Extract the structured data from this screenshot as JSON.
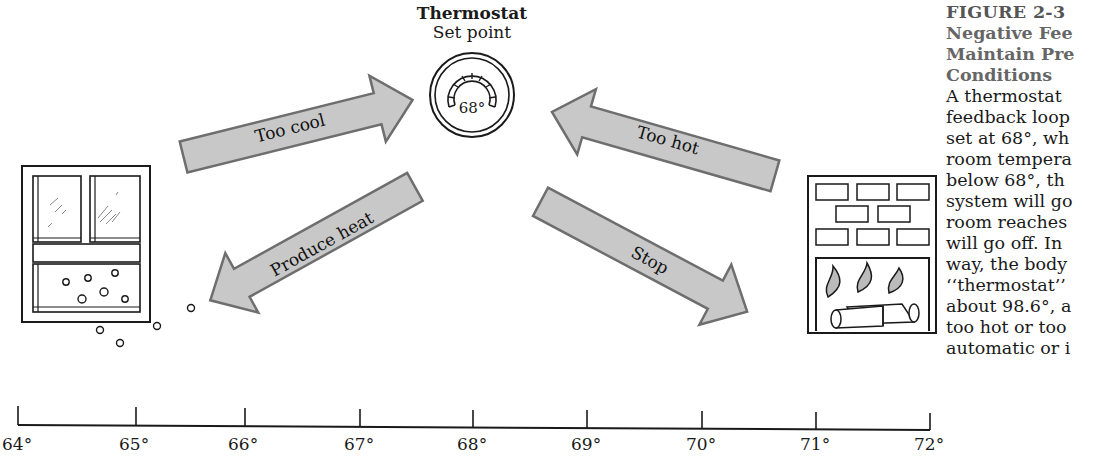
{
  "thermostat": {
    "title": "Thermostat",
    "subtitle": "Set point",
    "dial_value": "68°"
  },
  "arrows": {
    "too_cool": "Too cool",
    "produce_heat": "Produce heat",
    "too_hot": "Too hot",
    "stop": "Stop"
  },
  "scale": {
    "ticks": [
      "64°",
      "65°",
      "66°",
      "67°",
      "68°",
      "69°",
      "70°",
      "71°",
      "72°"
    ]
  },
  "caption": {
    "figure_label": "FIGURE 2-3",
    "title_lines": [
      "Negative Fee",
      "Maintain Pre",
      "Conditions"
    ],
    "body_lines": [
      "A thermostat",
      "feedback loop",
      "set at 68°, wh",
      "room tempera",
      "below 68°, th",
      "system will go",
      "room reaches",
      "will go off. In",
      "way, the body",
      "‘‘thermostat’’",
      "about 98.6°, a",
      "too hot or too",
      "automatic or i"
    ]
  },
  "colors": {
    "arrow_fill": "#c8c8c8",
    "arrow_stroke": "#6e6e6e",
    "line": "#1a1a1a"
  }
}
